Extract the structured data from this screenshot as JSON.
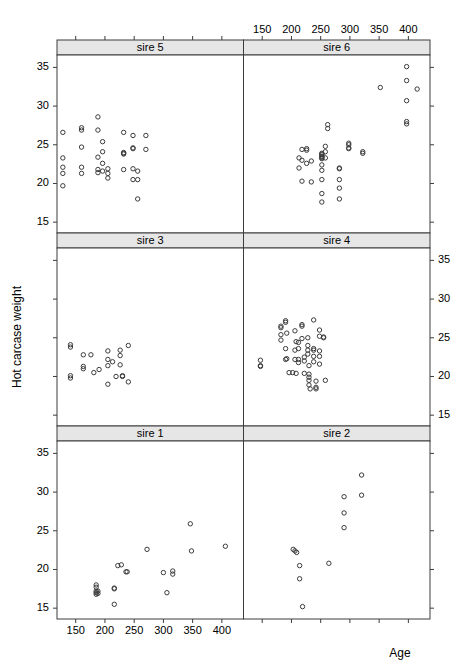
{
  "chart_data": {
    "type": "scatter",
    "title": "",
    "xlabel": "Age",
    "ylabel": "Hot carcase weight",
    "xlim": [
      118,
      437
    ],
    "ylim": [
      13.6,
      36.6
    ],
    "xticks": [
      150,
      200,
      250,
      300,
      350,
      400
    ],
    "yticks": [
      15,
      20,
      25,
      30,
      35
    ],
    "grid": false,
    "legend": "none",
    "layout": {
      "rows": 3,
      "cols": 2,
      "panel_order_bottom_to_top": true,
      "strip_position": "top",
      "x_axis_alternating": "bottom-left, top-right",
      "y_axis_alternating": "left-top, right-middle, left-bottom"
    },
    "panels": [
      {
        "label": "sire 5",
        "row": 0,
        "col": 0,
        "n": 37,
        "points": [
          [
            128,
            26.6
          ],
          [
            128,
            23.3
          ],
          [
            128,
            22.1
          ],
          [
            128,
            21.3
          ],
          [
            128,
            19.7
          ],
          [
            160,
            27.2
          ],
          [
            160,
            26.9
          ],
          [
            160,
            24.7
          ],
          [
            160,
            22.1
          ],
          [
            160,
            21.3
          ],
          [
            188,
            28.6
          ],
          [
            188,
            26.9
          ],
          [
            188,
            23.4
          ],
          [
            188,
            21.8
          ],
          [
            188,
            21.4
          ],
          [
            196,
            25.4
          ],
          [
            196,
            24.1
          ],
          [
            196,
            22.6
          ],
          [
            196,
            21.6
          ],
          [
            205,
            21.9
          ],
          [
            205,
            21.3
          ],
          [
            205,
            20.7
          ],
          [
            232,
            26.6
          ],
          [
            232,
            24.0
          ],
          [
            232,
            23.9
          ],
          [
            232,
            23.8
          ],
          [
            232,
            21.8
          ],
          [
            248,
            26.2
          ],
          [
            248,
            24.6
          ],
          [
            248,
            24.5
          ],
          [
            248,
            21.9
          ],
          [
            248,
            20.5
          ],
          [
            256,
            21.6
          ],
          [
            256,
            20.5
          ],
          [
            256,
            18.0
          ],
          [
            270,
            26.2
          ],
          [
            270,
            24.4
          ]
        ]
      },
      {
        "label": "sire 6",
        "row": 0,
        "col": 1,
        "n": 45,
        "points": [
          [
            213,
            23.3
          ],
          [
            213,
            22.0
          ],
          [
            218,
            24.4
          ],
          [
            218,
            23.0
          ],
          [
            218,
            20.3
          ],
          [
            226,
            24.5
          ],
          [
            226,
            24.3
          ],
          [
            226,
            22.6
          ],
          [
            234,
            22.9
          ],
          [
            234,
            20.2
          ],
          [
            252,
            23.9
          ],
          [
            252,
            23.8
          ],
          [
            252,
            23.7
          ],
          [
            252,
            23.5
          ],
          [
            252,
            23.4
          ],
          [
            252,
            23.3
          ],
          [
            252,
            23.2
          ],
          [
            252,
            22.4
          ],
          [
            252,
            21.7
          ],
          [
            252,
            20.5
          ],
          [
            252,
            18.7
          ],
          [
            252,
            17.6
          ],
          [
            258,
            24.8
          ],
          [
            258,
            23.3
          ],
          [
            258,
            24.1
          ],
          [
            262,
            27.6
          ],
          [
            262,
            27.1
          ],
          [
            282,
            22.0
          ],
          [
            282,
            21.9
          ],
          [
            282,
            20.5
          ],
          [
            282,
            19.4
          ],
          [
            282,
            18.0
          ],
          [
            298,
            25.2
          ],
          [
            298,
            25.0
          ],
          [
            298,
            24.6
          ],
          [
            298,
            24.5
          ],
          [
            322,
            24.1
          ],
          [
            322,
            23.9
          ],
          [
            352,
            32.4
          ],
          [
            397,
            35.1
          ],
          [
            397,
            33.3
          ],
          [
            397,
            30.7
          ],
          [
            397,
            28.0
          ],
          [
            397,
            27.7
          ],
          [
            415,
            32.2
          ]
        ]
      },
      {
        "label": "sire 3",
        "row": 1,
        "col": 0,
        "n": 22,
        "points": [
          [
            141,
            24.1
          ],
          [
            141,
            23.8
          ],
          [
            141,
            20.1
          ],
          [
            141,
            19.8
          ],
          [
            163,
            22.8
          ],
          [
            163,
            21.3
          ],
          [
            163,
            21.0
          ],
          [
            176,
            22.8
          ],
          [
            181,
            20.5
          ],
          [
            190,
            20.9
          ],
          [
            205,
            23.3
          ],
          [
            205,
            22.2
          ],
          [
            205,
            21.4
          ],
          [
            205,
            19.0
          ],
          [
            213,
            21.9
          ],
          [
            219,
            20.0
          ],
          [
            226,
            23.4
          ],
          [
            226,
            22.7
          ],
          [
            226,
            21.5
          ],
          [
            230,
            20.1
          ],
          [
            230,
            20.0
          ],
          [
            240,
            24.0
          ],
          [
            240,
            19.3
          ]
        ]
      },
      {
        "label": "sire 4",
        "row": 1,
        "col": 1,
        "n": 56,
        "points": [
          [
            147,
            22.1
          ],
          [
            147,
            21.4
          ],
          [
            147,
            21.3
          ],
          [
            182,
            26.5
          ],
          [
            182,
            26.3
          ],
          [
            182,
            25.4
          ],
          [
            182,
            24.7
          ],
          [
            190,
            27.2
          ],
          [
            190,
            27.0
          ],
          [
            190,
            23.6
          ],
          [
            190,
            22.2
          ],
          [
            192,
            25.6
          ],
          [
            192,
            22.3
          ],
          [
            196,
            20.5
          ],
          [
            202,
            20.5
          ],
          [
            206,
            25.9
          ],
          [
            206,
            23.4
          ],
          [
            206,
            22.2
          ],
          [
            208,
            24.5
          ],
          [
            208,
            20.4
          ],
          [
            212,
            24.4
          ],
          [
            212,
            23.6
          ],
          [
            212,
            22.2
          ],
          [
            212,
            21.8
          ],
          [
            218,
            26.7
          ],
          [
            218,
            26.5
          ],
          [
            218,
            24.9
          ],
          [
            222,
            22.5
          ],
          [
            222,
            22.0
          ],
          [
            222,
            20.4
          ],
          [
            228,
            25.0
          ],
          [
            228,
            24.0
          ],
          [
            228,
            23.4
          ],
          [
            228,
            22.9
          ],
          [
            230,
            21.4
          ],
          [
            230,
            20.3
          ],
          [
            230,
            19.9
          ],
          [
            230,
            19.5
          ],
          [
            230,
            18.9
          ],
          [
            232,
            18.4
          ],
          [
            238,
            27.3
          ],
          [
            238,
            23.6
          ],
          [
            238,
            23.4
          ],
          [
            238,
            22.6
          ],
          [
            238,
            21.9
          ],
          [
            242,
            19.4
          ],
          [
            242,
            18.6
          ],
          [
            242,
            18.4
          ],
          [
            248,
            26.0
          ],
          [
            248,
            25.2
          ],
          [
            248,
            23.3
          ],
          [
            248,
            22.6
          ],
          [
            248,
            21.6
          ],
          [
            255,
            25.1
          ],
          [
            255,
            25.0
          ],
          [
            258,
            19.5
          ]
        ]
      },
      {
        "label": "sire 1",
        "row": 2,
        "col": 0,
        "n": 22,
        "points": [
          [
            185,
            18.0
          ],
          [
            185,
            17.7
          ],
          [
            185,
            17.2
          ],
          [
            185,
            17.0
          ],
          [
            185,
            16.8
          ],
          [
            188,
            17.2
          ],
          [
            188,
            16.9
          ],
          [
            216,
            17.6
          ],
          [
            216,
            17.5
          ],
          [
            216,
            15.5
          ],
          [
            222,
            20.5
          ],
          [
            228,
            20.6
          ],
          [
            236,
            19.7
          ],
          [
            238,
            19.7
          ],
          [
            272,
            22.6
          ],
          [
            300,
            19.6
          ],
          [
            306,
            17.0
          ],
          [
            316,
            19.8
          ],
          [
            316,
            19.4
          ],
          [
            346,
            25.9
          ],
          [
            348,
            22.4
          ],
          [
            406,
            23.0
          ]
        ]
      },
      {
        "label": "sire 2",
        "row": 2,
        "col": 1,
        "n": 11,
        "points": [
          [
            203,
            22.6
          ],
          [
            206,
            22.4
          ],
          [
            209,
            22.2
          ],
          [
            214,
            20.5
          ],
          [
            214,
            18.8
          ],
          [
            219,
            15.2
          ],
          [
            264,
            20.8
          ],
          [
            290,
            29.4
          ],
          [
            290,
            27.3
          ],
          [
            290,
            25.4
          ],
          [
            320,
            32.2
          ],
          [
            320,
            29.6
          ]
        ]
      }
    ]
  },
  "axes": {
    "x_title": "Age",
    "y_title": "Hot carcase weight",
    "x_tick_labels": [
      "150",
      "200",
      "250",
      "300",
      "350",
      "400"
    ],
    "y_tick_labels": [
      "15",
      "20",
      "25",
      "30",
      "35"
    ]
  },
  "strips": {
    "sire5": "sire 5",
    "sire6": "sire 6",
    "sire3": "sire 3",
    "sire4": "sire 4",
    "sire1": "sire 1",
    "sire2": "sire 2"
  },
  "colors": {
    "point_stroke": "#3c3c3c",
    "strip_fill": "#e6e6e6",
    "frame": "#3c3c3c",
    "background": "#ffffff"
  }
}
